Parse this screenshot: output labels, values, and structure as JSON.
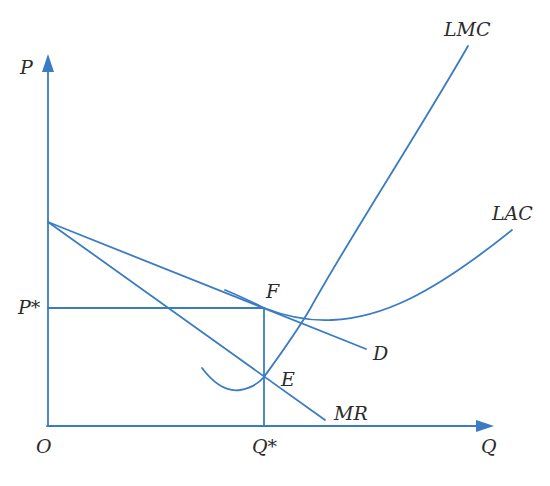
{
  "diagram": {
    "type": "economics-monopolistic-competition-long-run-equilibrium",
    "line_color": "#3a7cc4",
    "axes": {
      "y_label": "P",
      "x_label": "Q",
      "origin_label": "O"
    },
    "curves": {
      "lmc": "LMC",
      "lac": "LAC",
      "demand": "D",
      "mr": "MR"
    },
    "points": {
      "f": "F",
      "e": "E"
    },
    "equilibrium": {
      "price_label": "P*",
      "quantity_label": "Q*"
    }
  }
}
